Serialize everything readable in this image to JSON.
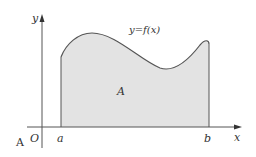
{
  "diagram": {
    "labels": {
      "y_axis": "y",
      "x_axis": "x",
      "origin": "O",
      "a": "a",
      "b": "b",
      "function": "y=f(x)",
      "area": "A",
      "corner": "A"
    },
    "colors": {
      "fill": "#e3e3e3",
      "curve": "#555555",
      "axis": "#555555",
      "text": "#333333"
    }
  }
}
